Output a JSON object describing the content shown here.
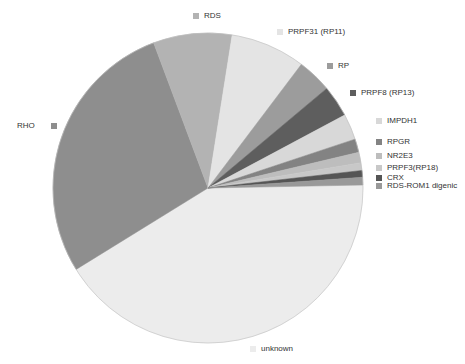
{
  "chart_data": {
    "type": "pie",
    "title": "",
    "start_angle_deg": -1.1,
    "direction": "clockwise",
    "categories": [
      "unknown",
      "RHO",
      "RDS",
      "PRPF31 (RP11)",
      "RP",
      "PRPF8 (RP13)",
      "IMPDH1",
      "RPGR",
      "NR2E3",
      "PRPF3(RP18)",
      "CRX",
      "RDS-ROM1 digenic"
    ],
    "values": [
      41.5,
      28.1,
      8.2,
      7.8,
      3.6,
      3.3,
      2.7,
      1.4,
      1.1,
      0.8,
      0.7,
      0.8
    ],
    "colors": [
      "#ececec",
      "#8e8e8e",
      "#b3b3b3",
      "#e4e4e4",
      "#9c9c9c",
      "#5e5e5e",
      "#d8d8d8",
      "#838383",
      "#bdbdbd",
      "#c8c8c8",
      "#555555",
      "#999999"
    ],
    "legend_position": "around-pie (labels adjacent to slices)",
    "grid": false
  },
  "legend": {
    "items": [
      {
        "label": "RDS",
        "color": "#b3b3b3",
        "x": 193,
        "y": 12,
        "side": "right"
      },
      {
        "label": "PRPF31 (RP11)",
        "color": "#e4e4e4",
        "x": 277,
        "y": 28,
        "side": "right"
      },
      {
        "label": "RP",
        "color": "#9c9c9c",
        "x": 327,
        "y": 62,
        "side": "right"
      },
      {
        "label": "PRPF8 (RP13)",
        "color": "#5e5e5e",
        "x": 350,
        "y": 89,
        "side": "right"
      },
      {
        "label": "IMPDH1",
        "color": "#d8d8d8",
        "x": 376,
        "y": 117,
        "side": "right"
      },
      {
        "label": "RPGR",
        "color": "#838383",
        "x": 376,
        "y": 138,
        "side": "right"
      },
      {
        "label": "NR2E3",
        "color": "#bdbdbd",
        "x": 376,
        "y": 152,
        "side": "right"
      },
      {
        "label": "PRPF3(RP18)",
        "color": "#c8c8c8",
        "x": 376,
        "y": 164,
        "side": "right"
      },
      {
        "label": "CRX",
        "color": "#555555",
        "x": 376,
        "y": 174,
        "side": "right"
      },
      {
        "label": "RDS-ROM1 digenic",
        "color": "#999999",
        "x": 376,
        "y": 182,
        "side": "right"
      },
      {
        "label": "unknown",
        "color": "#ececec",
        "x": 250,
        "y": 345,
        "side": "right"
      },
      {
        "label": "RHO",
        "color": "#8e8e8e",
        "x": 17,
        "y": 122,
        "side": "left"
      }
    ]
  },
  "pie": {
    "cx": 208,
    "cy": 188,
    "r": 155,
    "stroke": "#bdbdbd"
  }
}
